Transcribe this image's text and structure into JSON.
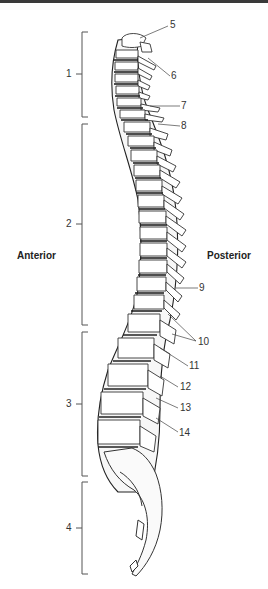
{
  "diagram": {
    "orientation_labels": {
      "left": "Anterior",
      "right": "Posterior"
    },
    "regions": [
      {
        "label": "1",
        "top": 32,
        "bottom": 117
      },
      {
        "label": "2",
        "top": 124,
        "bottom": 325
      },
      {
        "label": "3",
        "top": 332,
        "bottom": 476
      },
      {
        "label": "4",
        "top": 482,
        "bottom": 574
      }
    ],
    "callouts": [
      {
        "label": "5",
        "x": 170,
        "y": 20
      },
      {
        "label": "6",
        "x": 170,
        "y": 72
      },
      {
        "label": "7",
        "x": 180,
        "y": 102
      },
      {
        "label": "8",
        "x": 180,
        "y": 121
      },
      {
        "label": "9",
        "x": 198,
        "y": 283
      },
      {
        "label": "10",
        "x": 198,
        "y": 337
      },
      {
        "label": "11",
        "x": 189,
        "y": 361
      },
      {
        "label": "12",
        "x": 180,
        "y": 382
      },
      {
        "label": "13",
        "x": 180,
        "y": 403
      },
      {
        "label": "14",
        "x": 179,
        "y": 428
      }
    ]
  }
}
